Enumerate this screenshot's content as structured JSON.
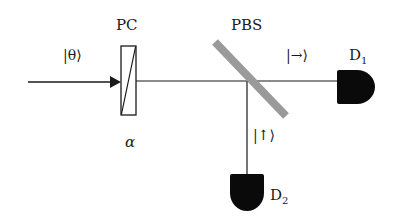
{
  "diagram": {
    "type": "optical-setup",
    "components": {
      "input_state": {
        "label": "|θ⟩"
      },
      "polarization_controller": {
        "label": "PC",
        "parameter": "α"
      },
      "beam_splitter": {
        "label": "PBS",
        "color": "#9a9a9a"
      },
      "detector_1": {
        "label": "D",
        "subscript": "1",
        "state": "|→⟩"
      },
      "detector_2": {
        "label": "D",
        "subscript": "2",
        "state": "|↑⟩"
      }
    },
    "colors": {
      "line": "#1a1a1a",
      "detector_fill": "#0a0a0a",
      "pbs": "#9a9a9a"
    }
  }
}
